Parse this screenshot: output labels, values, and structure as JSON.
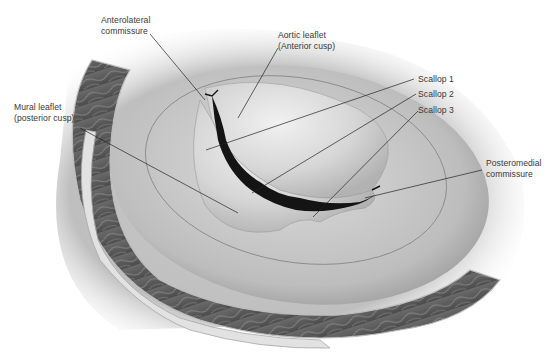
{
  "figure": {
    "colors": {
      "background": "#ffffff",
      "label_text": "#3a3a3a",
      "leader_line": "#222222",
      "leaflet_light": "#e6e6e6",
      "leaflet_mid": "#bdbdbd",
      "orifice_dark": "#141414",
      "muscle_dark": "#5a5a5a",
      "muscle_strands": "#8c8c8c"
    },
    "labels": [
      {
        "id": "anterolateral-commissure",
        "text": "Anterolateral\ncommissure"
      },
      {
        "id": "aortic-leaflet",
        "text": "Aortic leaflet\n(Anterior cusp)"
      },
      {
        "id": "scallop-1",
        "text": "Scallop 1"
      },
      {
        "id": "scallop-2",
        "text": "Scallop 2"
      },
      {
        "id": "scallop-3",
        "text": "Scallop 3"
      },
      {
        "id": "mural-leaflet",
        "text": "Mural leaflet\n(posterior cusp)"
      },
      {
        "id": "posteromedial-commissure",
        "text": "Posteromedial\ncommissure"
      }
    ]
  }
}
